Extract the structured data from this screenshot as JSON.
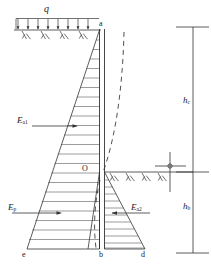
{
  "figure": {
    "type": "engineering-diagram",
    "background_color": "#ffffff",
    "line_color": "#333333",
    "hatch_color": "#555555",
    "dashed_color": "#333333"
  },
  "labels": {
    "surcharge": "q",
    "wall_top": "a",
    "pivot_point": "O",
    "wall_bottom": "b",
    "left_base": "e",
    "right_base": "d",
    "active_upper": "E",
    "active_upper_sub": "a1",
    "passive": "E",
    "passive_sub": "p",
    "active_lower": "E",
    "active_lower_sub": "a2",
    "height_upper": "h",
    "height_upper_sub": "c",
    "height_lower": "h",
    "height_lower_sub": "b"
  },
  "annotations": {
    "surcharge_arrow_count": 8,
    "ground_hatch_count_left": 4,
    "ground_hatch_count_right": 4,
    "pressure_hatch_lines_upper": 22,
    "pressure_hatch_lines_lower": 11,
    "deflection_curve": "dashed",
    "benchmark_symbol": "level-cross-circle"
  },
  "geometry": {
    "wall_top_y": 30,
    "wall_bottom_y": 249,
    "pivot_y": 172,
    "wall_x": 101,
    "left_base_x": 27,
    "right_base_x": 145,
    "dimension_line_x": 193
  }
}
